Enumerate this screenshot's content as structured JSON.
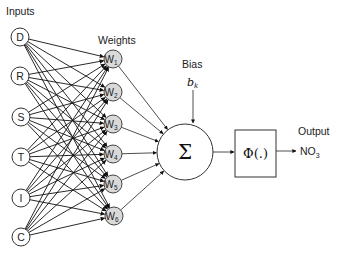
{
  "labels": {
    "inputs": "Inputs",
    "weights": "Weights",
    "bias": "Bias",
    "bias_symbol": "b",
    "bias_subscript": "k",
    "sum_symbol": "Σ",
    "activation": "Φ(.)",
    "output": "Output",
    "output_var": "NO",
    "output_subscript": "3"
  },
  "inputs": [
    {
      "id": "D",
      "label": "D",
      "x": 20,
      "y": 37
    },
    {
      "id": "R",
      "label": "R",
      "x": 20,
      "y": 76
    },
    {
      "id": "S",
      "label": "S",
      "x": 21,
      "y": 117
    },
    {
      "id": "T",
      "label": "T",
      "x": 21,
      "y": 157
    },
    {
      "id": "I",
      "label": "I",
      "x": 21,
      "y": 198
    },
    {
      "id": "C",
      "label": "C",
      "x": 21,
      "y": 237
    }
  ],
  "weights": [
    {
      "id": "W1",
      "label": "W",
      "sub": "1",
      "x": 113,
      "y": 59
    },
    {
      "id": "W2",
      "label": "W",
      "sub": "2",
      "x": 113,
      "y": 92
    },
    {
      "id": "W3",
      "label": "W",
      "sub": "3",
      "x": 113,
      "y": 124
    },
    {
      "id": "W4",
      "label": "W",
      "sub": "4",
      "x": 113,
      "y": 154
    },
    {
      "id": "W5",
      "label": "W",
      "sub": "5",
      "x": 113,
      "y": 184
    },
    {
      "id": "W6",
      "label": "W",
      "sub": "6",
      "x": 114,
      "y": 216
    }
  ],
  "summation": {
    "x": 185,
    "y": 152,
    "r": 28
  },
  "activation_box": {
    "x": 235,
    "y": 130,
    "w": 41,
    "h": 47
  },
  "colors": {
    "input_fill": "#ffffff",
    "weight_fill": "#d9d9d9",
    "stroke": "#222222"
  }
}
